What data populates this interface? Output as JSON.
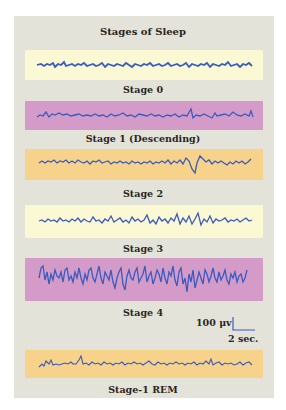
{
  "title": "Stages of Sleep",
  "colors": {
    "panel_bg": "#e4e3d9",
    "yellow": "#fbf8d4",
    "magenta": "#d49bc9",
    "orange": "#f7d28a",
    "trace": "#3a5bc0"
  },
  "stages": [
    {
      "label": "Stage 0",
      "strip_color": "yellow",
      "amplitude": "low",
      "frequency": "high"
    },
    {
      "label": "Stage 1 (Descending)",
      "strip_color": "magenta",
      "amplitude": "low",
      "frequency": "mixed"
    },
    {
      "label": "Stage 2",
      "strip_color": "orange",
      "amplitude": "low-medium",
      "feature": "K-complex"
    },
    {
      "label": "Stage 3",
      "strip_color": "yellow",
      "amplitude": "medium",
      "feature": "some slow waves"
    },
    {
      "label": "Stage 4",
      "strip_color": "magenta",
      "amplitude": "high",
      "feature": "delta waves"
    },
    {
      "label": "Stage-1 REM",
      "strip_color": "orange",
      "amplitude": "low",
      "frequency": "mixed"
    }
  ],
  "scale": {
    "voltage": "100 μv",
    "time": "2 sec."
  }
}
